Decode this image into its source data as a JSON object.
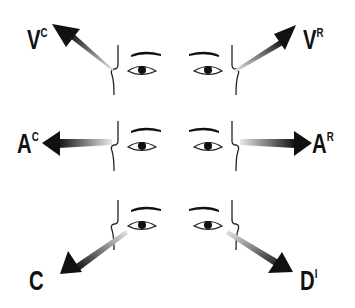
{
  "diagram": {
    "type": "eye-accessing-cues",
    "rows": [
      {
        "name": "visual",
        "left_label": {
          "main": "V",
          "sup": "C"
        },
        "right_label": {
          "main": "V",
          "sup": "R"
        },
        "arrow_direction_left": "up-left",
        "arrow_direction_right": "up-right"
      },
      {
        "name": "auditory",
        "left_label": {
          "main": "A",
          "sup": "C"
        },
        "right_label": {
          "main": "A",
          "sup": "R"
        },
        "arrow_direction_left": "left",
        "arrow_direction_right": "right"
      },
      {
        "name": "kinesthetic-dialogue",
        "left_label": {
          "main": "C",
          "sup": ""
        },
        "right_label": {
          "main": "D",
          "sup": "I"
        },
        "arrow_direction_left": "down-left",
        "arrow_direction_right": "down-right"
      }
    ],
    "colors": {
      "ink": "#111111",
      "arrow_dark": "#1a1a1a",
      "arrow_fade": "#dddddd",
      "background": "#ffffff"
    }
  }
}
